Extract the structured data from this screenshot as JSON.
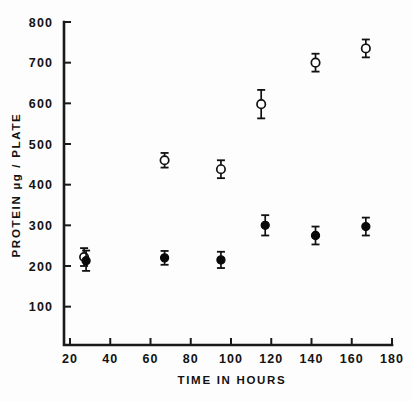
{
  "chart_data": {
    "type": "scatter",
    "title": "",
    "subtitle": "",
    "xlabel": "TIME IN HOURS",
    "ylabel": "PROTEIN µg / PLATE",
    "xlim": [
      16,
      182
    ],
    "ylim": [
      0,
      800
    ],
    "grid": false,
    "legend_position": "none",
    "xticks": [
      20,
      40,
      60,
      80,
      100,
      120,
      140,
      160,
      180
    ],
    "xticklabels": [
      "20",
      "40",
      "60",
      "80",
      "100",
      "120",
      "140",
      "160",
      "180"
    ],
    "yticks": [
      100,
      200,
      300,
      400,
      500,
      600,
      700,
      800
    ],
    "yticklabels": [
      "100",
      "200",
      "300",
      "400",
      "500",
      "600",
      "700",
      "800"
    ],
    "series": [
      {
        "name": "open-circles",
        "marker": "open-circle",
        "color": "#111111",
        "x": [
          27,
          67,
          95,
          115,
          142,
          167
        ],
        "values": [
          222,
          460,
          438,
          598,
          700,
          735
        ],
        "yerr": [
          22,
          18,
          22,
          35,
          22,
          22
        ]
      },
      {
        "name": "filled-circles",
        "marker": "filled-circle",
        "color": "#0a0a0a",
        "x": [
          28,
          67,
          95,
          117,
          142,
          167
        ],
        "values": [
          213,
          220,
          215,
          300,
          275,
          297
        ],
        "yerr": [
          25,
          17,
          20,
          25,
          22,
          22
        ]
      }
    ]
  },
  "axes": {
    "x_title": "TIME IN HOURS",
    "y_title": "PROTEIN µg / PLATE"
  }
}
